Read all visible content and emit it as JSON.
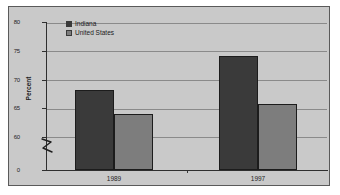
{
  "chart_data": {
    "type": "bar",
    "title": "",
    "xlabel": "",
    "ylabel": "Percent",
    "categories": [
      "1989",
      "1997"
    ],
    "series": [
      {
        "name": "Indiana",
        "values": [
          68.3,
          74.3
        ],
        "color": "#3a3a3a"
      },
      {
        "name": "United States",
        "values": [
          64.0,
          65.8
        ],
        "color": "#7d7d7d"
      }
    ],
    "ylim": [
      60,
      80
    ],
    "y_axis_break": true,
    "y_tick_labels": [
      "0",
      "60",
      "65",
      "70",
      "75",
      "80"
    ],
    "grid": true,
    "legend_position": "top-left",
    "plot_background": "#c9c9c9"
  },
  "axis": {
    "y_title": "Percent",
    "ticks": {
      "t80": "80",
      "t75": "75",
      "t70": "70",
      "t65": "65",
      "t60": "60",
      "t0": "0"
    },
    "x_labels": {
      "first": "1989",
      "second": "1997"
    }
  },
  "legend": {
    "items": [
      {
        "label": "Indiana",
        "color": "#3a3a3a"
      },
      {
        "label": "United States",
        "color": "#7d7d7d"
      }
    ]
  }
}
